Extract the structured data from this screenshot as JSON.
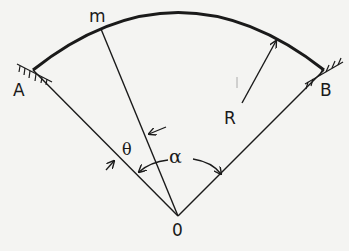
{
  "figure": {
    "colors": {
      "ink": "#1a1a1a",
      "paper": "#f4f4f2"
    },
    "points": {
      "A": {
        "label": "A",
        "x": 33,
        "y": 70
      },
      "B": {
        "label": "B",
        "x": 324,
        "y": 70
      },
      "O": {
        "label": "0",
        "x": 178,
        "y": 216
      },
      "m": {
        "label": "m",
        "x": 101,
        "y": 29
      }
    },
    "labels": {
      "radius": "R",
      "theta": "θ",
      "alpha": "α"
    },
    "supports": [
      {
        "name": "support-A",
        "type": "fixed-hinge",
        "at": "A"
      },
      {
        "name": "support-B",
        "type": "fixed-hinge",
        "at": "B"
      }
    ]
  }
}
